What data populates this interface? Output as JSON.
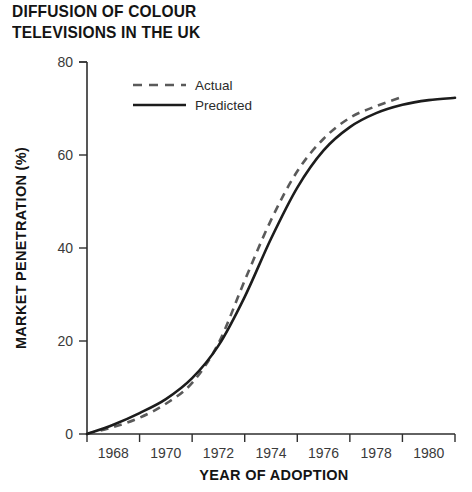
{
  "chart_data": {
    "type": "line",
    "title": "DIFFUSION OF COLOUR\nTELEVISIONS IN THE UK",
    "xlabel": "YEAR OF ADOPTION",
    "ylabel": "MARKET PENETRATION (%)",
    "xlim": [
      1967,
      1981
    ],
    "ylim": [
      0,
      80
    ],
    "grid": false,
    "legend_position": "top-left-inside",
    "xticks": [
      1968,
      1970,
      1972,
      1974,
      1976,
      1978,
      1980
    ],
    "xtick_labels": [
      "1968",
      "1970",
      "1972",
      "1974",
      "1976",
      "1978",
      "1980"
    ],
    "yticks": [
      0,
      20,
      40,
      60,
      80
    ],
    "ytick_labels": [
      "0",
      "20",
      "40",
      "60",
      "80"
    ],
    "x": [
      1967,
      1968,
      1969,
      1970,
      1971,
      1972,
      1973,
      1974,
      1975,
      1976,
      1977,
      1978,
      1979,
      1980,
      1981
    ],
    "series": [
      {
        "name": "Actual",
        "style": "dashed",
        "color": "#5a5a5a",
        "x": [
          1967,
          1968,
          1969,
          1970,
          1971,
          1972,
          1973,
          1974,
          1975,
          1976,
          1977,
          1978,
          1979
        ],
        "values": [
          0,
          1.5,
          3.5,
          6.5,
          11,
          19.5,
          33,
          46,
          56.5,
          63.5,
          68,
          70.5,
          72.5
        ]
      },
      {
        "name": "Predicted",
        "style": "solid",
        "color": "#1c1c1c",
        "x": [
          1967,
          1968,
          1969,
          1970,
          1971,
          1972,
          1973,
          1974,
          1975,
          1976,
          1977,
          1978,
          1979,
          1980,
          1981
        ],
        "values": [
          0,
          2,
          4.5,
          7.5,
          12,
          19,
          29.5,
          42,
          53,
          61,
          66,
          69,
          70.8,
          71.8,
          72.3
        ]
      }
    ]
  },
  "legend": {
    "entries": [
      {
        "label": "Actual",
        "style": "dashed"
      },
      {
        "label": "Predicted",
        "style": "solid"
      }
    ]
  },
  "colors": {
    "actual": "#5a5a5a",
    "predicted": "#1c1c1c",
    "axis": "#2e2e2e",
    "text": "#141414",
    "background": "#ffffff"
  }
}
